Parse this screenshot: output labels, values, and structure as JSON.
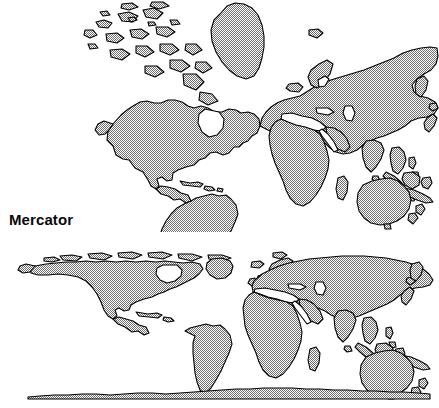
{
  "figure": {
    "background_color": "#ffffff",
    "land_fill_color": "#a9a9a9",
    "land_outline_color": "#000000",
    "label_color": "#0a0a0a",
    "width": 439,
    "height": 408
  },
  "panels": [
    {
      "id": "mercator",
      "label": "Mercator",
      "projection_name": "Mercator",
      "description": "World map drawn on the Mercator projection; polar regions greatly enlarged, Greenland appears as large as South America, Antarctica not shown.",
      "label_position": {
        "x": 9,
        "y": 211
      }
    },
    {
      "id": "cylindrical-equal-area",
      "label": "Cylindrical\nequal area",
      "label_line_1": "Cylindrical",
      "label_line_2": "equal area",
      "projection_name": "Cylindrical equal area",
      "description": "World map drawn on a cylindrical equal-area projection; high latitudes strongly compressed vertically, Antarctica flattened into a thin strip along the bottom edge.",
      "label_position": {
        "x": 9,
        "y": 343
      }
    }
  ],
  "landmasses": [
    "North America",
    "Greenland",
    "Canadian Arctic Archipelago",
    "Iceland",
    "South America",
    "Europe",
    "Scandinavia",
    "Great Britain",
    "Africa",
    "Madagascar",
    "Asia",
    "Siberia",
    "Kamchatka",
    "Japan",
    "India",
    "Sri Lanka",
    "Indonesia",
    "Borneo",
    "New Guinea",
    "Australia",
    "New Zealand",
    "Antarctica"
  ]
}
